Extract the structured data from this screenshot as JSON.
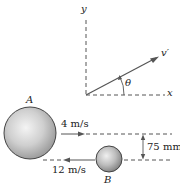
{
  "figure": {
    "axes": {
      "x_label": "x",
      "y_label": "y",
      "angle_label": "θ",
      "velocity_label": "v′"
    },
    "ball_a": {
      "label": "A",
      "speed": "4 m/s"
    },
    "ball_b": {
      "label": "B",
      "speed": "12 m/s"
    },
    "offset": "75 mm"
  }
}
